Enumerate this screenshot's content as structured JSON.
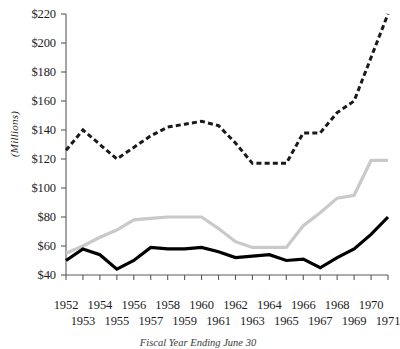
{
  "figure": {
    "caption": "Fiscal Year Ending June 30",
    "ylabel": "(Millions)"
  },
  "axis": {
    "y_ticks": [
      "$220",
      "$200",
      "$180",
      "$160",
      "$140",
      "$120",
      "$100",
      "$80",
      "$60",
      "$40"
    ],
    "x_ticks_upper": [
      "1952",
      "1954",
      "1956",
      "1958",
      "1960",
      "1962",
      "1964",
      "1966",
      "1968",
      "1970"
    ],
    "x_ticks_lower": [
      "1953",
      "1955",
      "1957",
      "1959",
      "1961",
      "1963",
      "1965",
      "1967",
      "1969",
      "1971"
    ]
  },
  "colors": {
    "series_dashed": "#1a1a1a",
    "series_gray": "#c9c9c9",
    "series_solid": "#000000",
    "axis": "#5a5a5a",
    "background": "#ffffff"
  },
  "chart_data": {
    "type": "line",
    "title": "",
    "subtitle": "",
    "xlabel": "Fiscal Year Ending June 30",
    "ylabel": "(Millions)",
    "xlim": [
      1952,
      1971
    ],
    "ylim": [
      40,
      220
    ],
    "y_tick_step": 20,
    "grid": false,
    "legend": "none",
    "x": [
      1952,
      1953,
      1954,
      1955,
      1956,
      1957,
      1958,
      1959,
      1960,
      1961,
      1962,
      1963,
      1964,
      1965,
      1966,
      1967,
      1968,
      1969,
      1970,
      1971
    ],
    "series": [
      {
        "name": "dashed-series",
        "style": "dashed",
        "color": "#1a1a1a",
        "values": [
          126,
          140,
          130,
          120,
          128,
          136,
          142,
          144,
          146,
          143,
          131,
          117,
          117,
          117,
          138,
          138,
          152,
          160,
          190,
          220
        ]
      },
      {
        "name": "gray-series",
        "style": "solid",
        "color": "#c9c9c9",
        "values": [
          55,
          60,
          66,
          71,
          78,
          79,
          80,
          80,
          80,
          72,
          63,
          59,
          59,
          59,
          74,
          83,
          93,
          95,
          119,
          119
        ]
      },
      {
        "name": "black-series",
        "style": "solid",
        "color": "#000000",
        "values": [
          50,
          58,
          54,
          44,
          50,
          59,
          58,
          58,
          59,
          56,
          52,
          53,
          54,
          50,
          51,
          45,
          52,
          58,
          68,
          80
        ]
      }
    ]
  }
}
